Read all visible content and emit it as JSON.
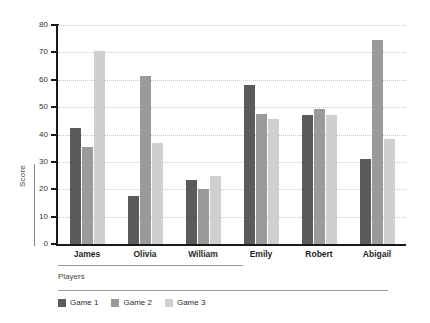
{
  "chart_data": {
    "type": "bar",
    "title": "",
    "subtitle": "",
    "xlabel": "Players",
    "ylabel": "Score",
    "categories": [
      "James",
      "Olivia",
      "William",
      "Emily",
      "Robert",
      "Abigail"
    ],
    "series": [
      {
        "name": "Game 1",
        "color": "#5b5b5b",
        "values": [
          42.5,
          17.5,
          23.5,
          58.0,
          47.0,
          31.0
        ]
      },
      {
        "name": "Game 2",
        "color": "#9a9a9a",
        "values": [
          35.5,
          61.5,
          20.0,
          47.5,
          49.5,
          74.5
        ]
      },
      {
        "name": "Game 3",
        "color": "#cfcfcf",
        "values": [
          70.5,
          37.0,
          25.0,
          45.5,
          47.0,
          38.5
        ]
      }
    ],
    "ylim": [
      0,
      80
    ],
    "ytick_labels": [
      "80",
      "70",
      "60",
      "50",
      "40",
      "30",
      "20",
      "10",
      "0"
    ],
    "ytick_values": [
      80,
      70,
      60,
      50,
      40,
      30,
      20,
      10,
      0
    ],
    "grid": "horizontal-dotted",
    "legend_position": "bottom-left",
    "legend_entries": [
      "Game 1",
      "Game 2",
      "Game 3"
    ]
  }
}
